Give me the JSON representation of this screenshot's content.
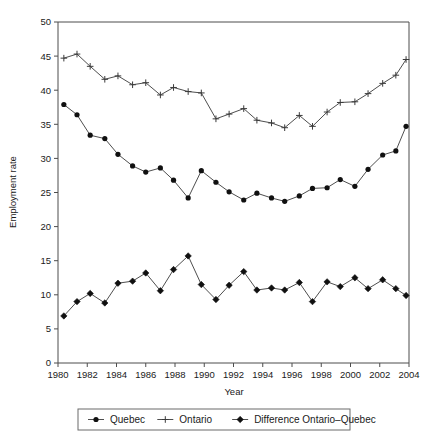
{
  "chart_data": {
    "type": "line",
    "title": "",
    "xlabel": "Year",
    "ylabel": "Employment rate",
    "xlim": [
      1980,
      2004
    ],
    "ylim": [
      0,
      50
    ],
    "xticks": [
      1980,
      1982,
      1984,
      1986,
      1988,
      1990,
      1992,
      1994,
      1996,
      1998,
      2000,
      2002,
      2004
    ],
    "yticks": [
      0,
      5,
      10,
      15,
      20,
      25,
      30,
      35,
      40,
      45,
      50
    ],
    "grid": false,
    "legend_position": "bottom",
    "x": [
      1980.4,
      1981.3,
      1982.2,
      1983.2,
      1984.1,
      1985.1,
      1986.0,
      1987.0,
      1987.9,
      1988.9,
      1989.8,
      1990.8,
      1991.7,
      1992.7,
      1993.6,
      1994.6,
      1995.5,
      1996.5,
      1997.4,
      1998.4,
      1999.3,
      2000.3,
      2001.2,
      2002.2,
      2003.1
    ],
    "series": [
      {
        "name": "Quebec",
        "marker": "circle",
        "values": [
          37.9,
          36.4,
          33.4,
          32.9,
          30.6,
          28.9,
          28.0,
          28.6,
          26.8,
          24.2,
          28.2,
          26.5,
          25.1,
          23.9,
          24.9,
          24.2,
          23.7,
          24.5,
          25.6,
          25.7,
          26.9,
          25.9,
          28.4,
          30.5,
          31.1
        ]
      },
      {
        "name": "Ontario",
        "marker": "plus",
        "values": [
          44.7,
          45.3,
          43.5,
          41.6,
          42.1,
          40.8,
          41.1,
          39.3,
          40.4,
          39.8,
          39.6,
          35.8,
          36.5,
          37.3,
          35.6,
          35.2,
          34.5,
          36.3,
          34.7,
          36.8,
          38.2,
          38.3,
          39.5,
          41.0,
          42.2
        ]
      },
      {
        "name": "Difference Ontario-Quebec",
        "marker": "diamond",
        "values": [
          6.9,
          9.0,
          10.2,
          8.8,
          11.7,
          12.0,
          13.2,
          10.6,
          13.7,
          15.7,
          11.5,
          9.3,
          11.4,
          13.4,
          10.7,
          11.0,
          10.7,
          11.8,
          9.0,
          11.9,
          11.2,
          12.5,
          10.9,
          12.2,
          10.9
        ]
      }
    ],
    "extra_points": {
      "quebec_last": {
        "x": 2003.8,
        "y": 34.7
      },
      "ontario_last": {
        "x": 2003.8,
        "y": 44.5
      },
      "difference_last": {
        "x": 2003.8,
        "y": 9.9
      }
    }
  },
  "legend": {
    "items": [
      {
        "label": "Quebec",
        "marker": "circle"
      },
      {
        "label": "Ontario",
        "marker": "plus"
      },
      {
        "label": "Difference Ontario–Quebec",
        "marker": "diamond"
      }
    ]
  }
}
